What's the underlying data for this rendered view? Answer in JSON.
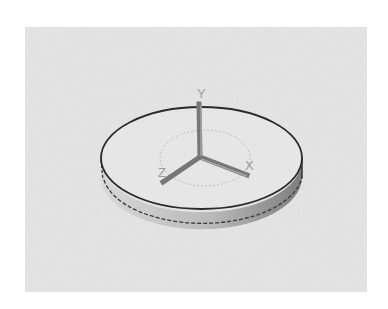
{
  "diagram": {
    "type": "3d-cylinder-with-axes",
    "colors": {
      "background": "#ffffff",
      "viewport": "#e4e4e4",
      "disk_top": "#e8e8e8",
      "disk_side_light": "#d6d6d6",
      "disk_side_dark": "#8a8a8a",
      "outline": "#2a2a2a",
      "axis": "#7a7a7a",
      "label": "#9a9a9a"
    },
    "axes": {
      "x_label": "X",
      "y_label": "Y",
      "z_label": "Z"
    }
  }
}
